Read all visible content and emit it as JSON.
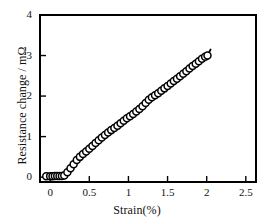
{
  "chart_data": {
    "type": "scatter",
    "title": "",
    "subtitle": "",
    "xlabel": "Strain(%)",
    "ylabel": "Resistance change / mΩ",
    "xlim": [
      -0.13,
      2.63
    ],
    "ylim": [
      -0.12,
      4.0
    ],
    "xticks": [
      "0",
      "0.5",
      "1",
      "1.5",
      "2",
      "2.5"
    ],
    "xtick_values": [
      0,
      0.5,
      1,
      1.5,
      2,
      2.5
    ],
    "yticks": [
      "0",
      "1",
      "2",
      "3",
      "4"
    ],
    "ytick_values": [
      0,
      1,
      2,
      3,
      4
    ],
    "grid": false,
    "legend": null,
    "legend_position": "none",
    "marker": "open-circle",
    "marker_size": 7,
    "line_color": "#000000",
    "marker_edge_color": "#000000",
    "marker_face_color": "#ffffff",
    "series": [
      {
        "name": "Resistance change vs strain",
        "x": [
          -0.05,
          0.0,
          0.03,
          0.06,
          0.09,
          0.12,
          0.15,
          0.18,
          0.22,
          0.26,
          0.3,
          0.34,
          0.38,
          0.42,
          0.46,
          0.5,
          0.54,
          0.58,
          0.62,
          0.66,
          0.7,
          0.74,
          0.78,
          0.82,
          0.86,
          0.9,
          0.94,
          0.98,
          1.02,
          1.06,
          1.1,
          1.14,
          1.18,
          1.22,
          1.26,
          1.3,
          1.34,
          1.38,
          1.42,
          1.46,
          1.5,
          1.54,
          1.58,
          1.62,
          1.66,
          1.7,
          1.74,
          1.78,
          1.82,
          1.86,
          1.9,
          1.94,
          1.98,
          2.01
        ],
        "y": [
          0.02,
          0.02,
          0.02,
          0.03,
          0.03,
          0.03,
          0.03,
          0.04,
          0.12,
          0.22,
          0.32,
          0.42,
          0.5,
          0.57,
          0.63,
          0.7,
          0.77,
          0.84,
          0.91,
          0.98,
          1.04,
          1.1,
          1.16,
          1.21,
          1.27,
          1.33,
          1.39,
          1.45,
          1.5,
          1.56,
          1.62,
          1.68,
          1.75,
          1.83,
          1.91,
          1.97,
          2.02,
          2.07,
          2.13,
          2.19,
          2.25,
          2.31,
          2.37,
          2.43,
          2.49,
          2.55,
          2.61,
          2.68,
          2.74,
          2.8,
          2.86,
          2.92,
          2.97,
          3.0
        ],
        "line_extends_to": [
          2.05,
          3.15
        ]
      }
    ]
  }
}
